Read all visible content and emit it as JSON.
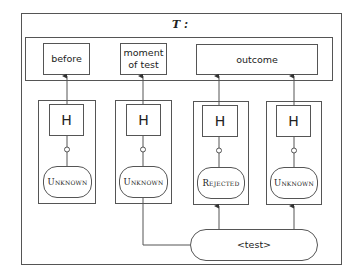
{
  "diagram": {
    "title": "T :",
    "top_boxes": [
      {
        "label": "before"
      },
      {
        "label": "moment of test"
      },
      {
        "label": "outcome"
      }
    ],
    "columns": [
      {
        "head": "H",
        "state": "Unknown"
      },
      {
        "head": "H",
        "state": "Unknown"
      },
      {
        "head": "H",
        "state": "Rejected"
      },
      {
        "head": "H",
        "state": "Unknown"
      }
    ],
    "test_node": {
      "label": "<test>"
    },
    "colors": {
      "stroke": "#555555",
      "background": "#ffffff",
      "text": "#222222"
    }
  }
}
